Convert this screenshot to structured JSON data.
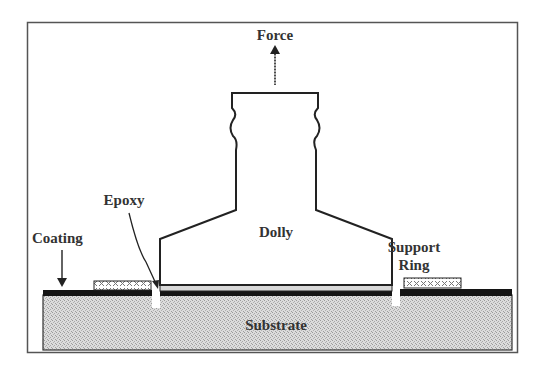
{
  "diagram": {
    "labels": {
      "force": "Force",
      "epoxy": "Epoxy",
      "coating": "Coating",
      "dolly": "Dolly",
      "support_ring_line1": "Support",
      "support_ring_line2": "Ring",
      "substrate": "Substrate"
    },
    "colors": {
      "line": "#222222",
      "coating": "#141414",
      "substrate_fill": "#d6d6d6",
      "frame": "#555555",
      "text": "#333333"
    }
  }
}
